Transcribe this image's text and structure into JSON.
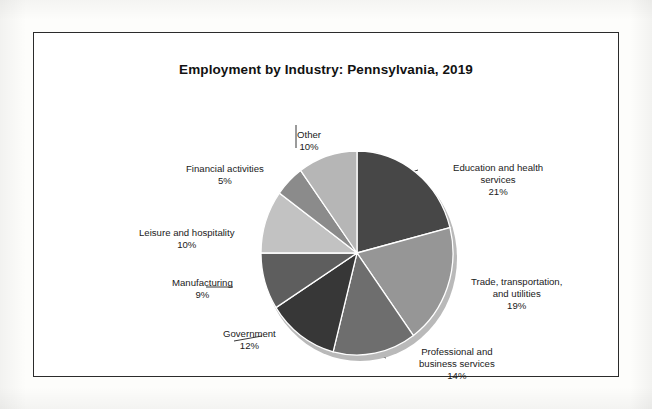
{
  "figure": {
    "title": "Employment by Industry: Pennsylvania, 2019"
  },
  "chart_data": {
    "type": "pie",
    "title": "Employment by Industry: Pennsylvania, 2019",
    "xlabel": "",
    "ylabel": "",
    "unit": "percent",
    "legend_position": "none",
    "labels_position": "outside-with-leader-lines",
    "start_angle_deg": 0,
    "direction": "clockwise",
    "categories": [
      "Education and health services",
      "Trade, transportation, and utilities",
      "Professional and business services",
      "Government",
      "Manufacturing",
      "Leisure and hospitality",
      "Financial activities",
      "Other"
    ],
    "values": [
      21,
      19,
      14,
      12,
      9,
      10,
      5,
      10
    ],
    "value_labels": [
      "21%",
      "19%",
      "14%",
      "12%",
      "9%",
      "10%",
      "5%",
      "10%"
    ],
    "colors": [
      "#474747",
      "#969696",
      "#6e6e6e",
      "#373737",
      "#5e5e5e",
      "#c2c2c2",
      "#8b8b8b",
      "#b6b6b6"
    ],
    "slices": [
      {
        "name": "Education and health services",
        "value": 21,
        "value_label": "21%",
        "color": "#474747",
        "label_line1": "Education and health",
        "label_line2": "services"
      },
      {
        "name": "Trade, transportation, and utilities",
        "value": 19,
        "value_label": "19%",
        "color": "#969696",
        "label_line1": "Trade, transportation,",
        "label_line2": "and utilities"
      },
      {
        "name": "Professional and business services",
        "value": 14,
        "value_label": "14%",
        "color": "#6e6e6e",
        "label_line1": "Professional and",
        "label_line2": "business services"
      },
      {
        "name": "Government",
        "value": 12,
        "value_label": "12%",
        "color": "#373737",
        "label_line1": "Government",
        "label_line2": ""
      },
      {
        "name": "Manufacturing",
        "value": 9,
        "value_label": "9%",
        "color": "#5e5e5e",
        "label_line1": "Manufacturing",
        "label_line2": ""
      },
      {
        "name": "Leisure and hospitality",
        "value": 10,
        "value_label": "10%",
        "color": "#c2c2c2",
        "label_line1": "Leisure and hospitality",
        "label_line2": ""
      },
      {
        "name": "Financial activities",
        "value": 5,
        "value_label": "5%",
        "color": "#8b8b8b",
        "label_line1": "Financial activities",
        "label_line2": ""
      },
      {
        "name": "Other",
        "value": 10,
        "value_label": "10%",
        "color": "#b6b6b6",
        "label_line1": "Other",
        "label_line2": ""
      }
    ]
  }
}
